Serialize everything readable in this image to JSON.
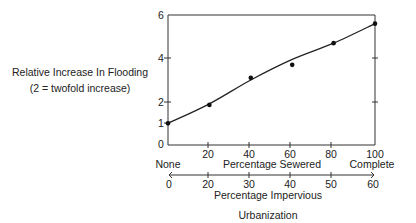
{
  "chart_data": {
    "type": "line",
    "title": "",
    "ylabel": "Relative Increase In Flooding",
    "ylabel_note": "(2 = twofold increase)",
    "xlabel_primary": "Percentage Sewered",
    "xlabel_secondary": "Percentage Impervious",
    "xlabel_overall": "Urbanization",
    "x_start_label": "None",
    "x_end_label": "Complete",
    "ylim": [
      0,
      6
    ],
    "xlim": [
      0,
      100
    ],
    "y_ticks": [
      0,
      1,
      2,
      4,
      6
    ],
    "y_minor_ticks_right": [
      2,
      4
    ],
    "x_ticks_sewered": [
      20,
      40,
      60,
      80,
      100
    ],
    "x_ticks_impervious": [
      0,
      20,
      30,
      40,
      50,
      60
    ],
    "series": [
      {
        "name": "Observed points",
        "x": [
          0,
          20,
          40,
          60,
          80,
          100
        ],
        "values": [
          1.0,
          1.85,
          3.1,
          3.7,
          4.7,
          5.6
        ]
      },
      {
        "name": "Fitted curve",
        "x": [
          0,
          20,
          40,
          60,
          80,
          100
        ],
        "values": [
          1.0,
          1.9,
          3.0,
          3.95,
          4.7,
          5.6
        ]
      }
    ],
    "grid": false,
    "legend": "none"
  },
  "labels": {
    "ylabel": "Relative Increase In Flooding",
    "ylabel_note": "(2 = twofold increase)",
    "none": "None",
    "complete": "Complete",
    "sewered": "Percentage Sewered",
    "impervious": "Percentage Impervious",
    "urbanization": "Urbanization",
    "y0": "0",
    "y1": "1",
    "y2": "2",
    "y4": "4",
    "y6": "6",
    "s20": "20",
    "s40": "40",
    "s60": "60",
    "s80": "80",
    "s100": "100",
    "i0": "0",
    "i20": "20",
    "i30": "30",
    "i40": "40",
    "i50": "50",
    "i60": "60"
  }
}
